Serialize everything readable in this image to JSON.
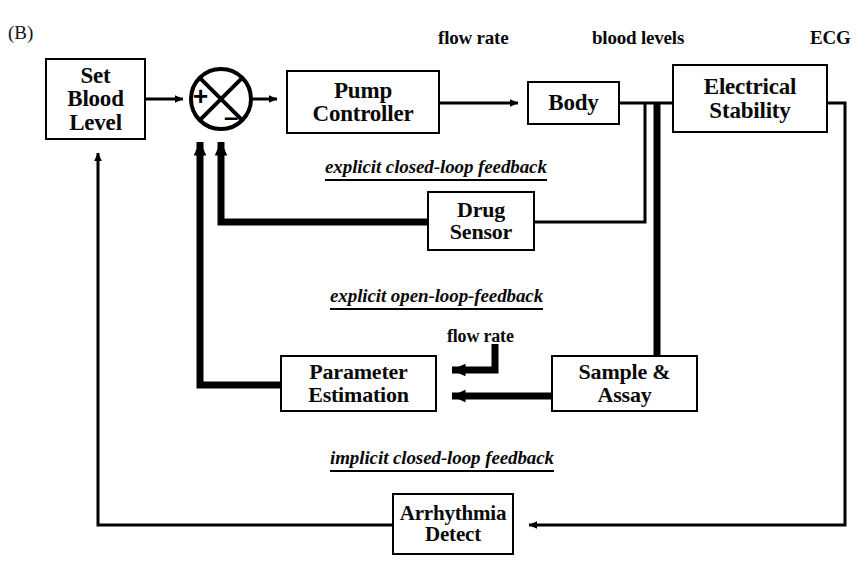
{
  "figure": {
    "panel_tag": "(B)",
    "type": "control-system-block-diagram",
    "background": "#ffffff",
    "line_color": "#000000"
  },
  "signal_labels": [
    {
      "name": "flow-rate-top",
      "text": "flow rate",
      "x": 438,
      "y": 30
    },
    {
      "name": "blood-levels",
      "text": "blood levels",
      "x": 592,
      "y": 30
    },
    {
      "name": "ecg",
      "text": "ECG",
      "x": 810,
      "y": 30
    },
    {
      "name": "flow-rate-mid",
      "text": "flow rate",
      "x": 447,
      "y": 330
    }
  ],
  "blocks": [
    {
      "name": "set-blood-level",
      "lines": [
        "Set",
        "Blood",
        "Level"
      ],
      "x": 45,
      "y": 58,
      "w": 101,
      "h": 82,
      "font_size": 23
    },
    {
      "name": "pump-controller",
      "lines": [
        "Pump",
        "Controller"
      ],
      "x": 286,
      "y": 70,
      "w": 154,
      "h": 64,
      "font_size": 23
    },
    {
      "name": "body",
      "lines": [
        "Body"
      ],
      "x": 527,
      "y": 81,
      "w": 93,
      "h": 44,
      "font_size": 23
    },
    {
      "name": "electrical-stability",
      "lines": [
        "Electrical",
        "Stability"
      ],
      "x": 672,
      "y": 64,
      "w": 156,
      "h": 69,
      "font_size": 23
    },
    {
      "name": "drug-sensor",
      "lines": [
        "Drug",
        "Sensor"
      ],
      "x": 427,
      "y": 191,
      "w": 108,
      "h": 60,
      "font_size": 22
    },
    {
      "name": "parameter-estimation",
      "lines": [
        "Parameter",
        "Estimation"
      ],
      "x": 280,
      "y": 355,
      "w": 157,
      "h": 57,
      "font_size": 22
    },
    {
      "name": "sample-assay",
      "lines": [
        "Sample &",
        "Assay"
      ],
      "x": 551,
      "y": 355,
      "w": 147,
      "h": 57,
      "font_size": 22
    },
    {
      "name": "arrhythmia-detect",
      "lines": [
        "Arrhythmia",
        "Detect"
      ],
      "x": 392,
      "y": 493,
      "w": 122,
      "h": 62,
      "font_size": 21
    }
  ],
  "summing_junction": {
    "name": "summing-junction",
    "cx": 221,
    "cy": 99,
    "r": 30,
    "plus_sign": "+",
    "minus_sign": "–",
    "plus_x": 200,
    "plus_y": 95,
    "minus_x": 231,
    "minus_y": 115
  },
  "feedback_labels": [
    {
      "name": "explicit-closed-loop-feedback",
      "text": "explicit closed-loop feedback",
      "x": 325,
      "y": 160,
      "font_size": 19
    },
    {
      "name": "explicit-open-loop-feedback",
      "text": "explicit open-loop-feedback",
      "x": 330,
      "y": 289,
      "font_size": 19
    },
    {
      "name": "implicit-closed-loop-feedback",
      "text": "implicit closed-loop feedback",
      "x": 330,
      "y": 451,
      "font_size": 19
    }
  ],
  "connections": [
    {
      "name": "set-blood-level-to-sum",
      "from": "set-blood-level",
      "to": "summing-junction",
      "weight": "thin"
    },
    {
      "name": "sum-to-pump-controller",
      "from": "summing-junction",
      "to": "pump-controller",
      "weight": "thin"
    },
    {
      "name": "pump-controller-to-body",
      "from": "pump-controller",
      "to": "body",
      "weight": "thin",
      "signal": "flow rate"
    },
    {
      "name": "body-to-electrical-stability",
      "from": "body",
      "to": "electrical-stability",
      "weight": "thin",
      "signal": "blood levels"
    },
    {
      "name": "body-to-drug-sensor",
      "from": "body",
      "to": "drug-sensor",
      "weight": "thin"
    },
    {
      "name": "drug-sensor-to-sum",
      "from": "drug-sensor",
      "to": "summing-junction",
      "weight": "thick"
    },
    {
      "name": "body-to-sample-assay",
      "from": "body",
      "to": "sample-assay",
      "weight": "thick"
    },
    {
      "name": "sample-assay-to-parameter-estimation",
      "from": "sample-assay",
      "to": "parameter-estimation",
      "weight": "thick"
    },
    {
      "name": "flow-rate-to-parameter-estimation",
      "from": "flow rate",
      "to": "parameter-estimation",
      "weight": "thick"
    },
    {
      "name": "parameter-estimation-to-sum",
      "from": "parameter-estimation",
      "to": "summing-junction",
      "weight": "thick"
    },
    {
      "name": "electrical-stability-to-arrhythmia-detect",
      "from": "electrical-stability",
      "to": "arrhythmia-detect",
      "weight": "thin",
      "signal": "ECG"
    },
    {
      "name": "arrhythmia-detect-to-set-blood-level",
      "from": "arrhythmia-detect",
      "to": "set-blood-level",
      "weight": "thin"
    }
  ]
}
